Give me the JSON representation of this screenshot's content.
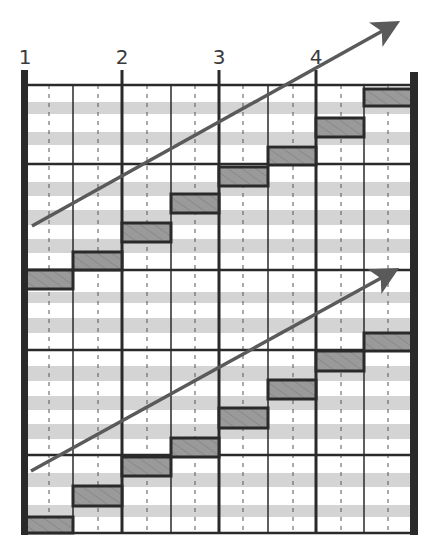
{
  "diagram": {
    "type": "staggered-step-pattern",
    "column_labels": [
      {
        "text": "1",
        "x": 25
      },
      {
        "text": "2",
        "x": 122
      },
      {
        "text": "3",
        "x": 219
      },
      {
        "text": "4",
        "x": 316
      }
    ],
    "colors": {
      "line": "#2a2a2a",
      "stripe": "#d4d4d4",
      "bar_fill": "#9a9a9a",
      "bar_hatch": "#7a7a7a",
      "arrow": "#5a5a5a",
      "label": "#3a3a3a"
    },
    "grid": {
      "left": 25,
      "right": 413,
      "top": 85,
      "bottom": 533,
      "major_vlines": [
        25,
        122,
        219,
        316,
        413
      ],
      "minor_vlines": [
        73,
        171,
        268,
        364
      ],
      "dashed_vlines": [
        49,
        98,
        147,
        195,
        243,
        293,
        341,
        388
      ],
      "hlines": [
        85,
        164,
        270,
        350,
        455,
        533
      ],
      "stripes": [
        [
          102,
          114
        ],
        [
          132,
          145
        ],
        [
          182,
          196
        ],
        [
          210,
          225
        ],
        [
          239,
          253
        ],
        [
          292,
          303
        ],
        [
          318,
          333
        ],
        [
          366,
          381
        ],
        [
          396,
          410
        ],
        [
          424,
          439
        ],
        [
          473,
          487
        ],
        [
          505,
          517
        ]
      ]
    },
    "bar_groups": [
      {
        "name": "upper-steps",
        "bars": [
          {
            "x": 25,
            "w": 48,
            "y": 270,
            "h": 19
          },
          {
            "x": 73,
            "w": 49,
            "y": 252,
            "h": 18
          },
          {
            "x": 122,
            "w": 49,
            "y": 223,
            "h": 19
          },
          {
            "x": 171,
            "w": 48,
            "y": 194,
            "h": 19
          },
          {
            "x": 219,
            "w": 49,
            "y": 167,
            "h": 19
          },
          {
            "x": 268,
            "w": 48,
            "y": 147,
            "h": 18
          },
          {
            "x": 316,
            "w": 48,
            "y": 118,
            "h": 19
          },
          {
            "x": 364,
            "w": 49,
            "y": 89,
            "h": 17
          }
        ]
      },
      {
        "name": "lower-steps",
        "bars": [
          {
            "x": 25,
            "w": 48,
            "y": 517,
            "h": 16
          },
          {
            "x": 73,
            "w": 49,
            "y": 486,
            "h": 20
          },
          {
            "x": 122,
            "w": 49,
            "y": 457,
            "h": 19
          },
          {
            "x": 171,
            "w": 48,
            "y": 438,
            "h": 19
          },
          {
            "x": 219,
            "w": 49,
            "y": 408,
            "h": 20
          },
          {
            "x": 268,
            "w": 48,
            "y": 380,
            "h": 19
          },
          {
            "x": 316,
            "w": 48,
            "y": 351,
            "h": 20
          },
          {
            "x": 364,
            "w": 49,
            "y": 333,
            "h": 18
          }
        ]
      }
    ],
    "arrows": [
      {
        "name": "upper-trend-arrow",
        "x1": 32,
        "y1": 226,
        "x2": 402,
        "y2": 20
      },
      {
        "name": "lower-trend-arrow",
        "x1": 31,
        "y1": 471,
        "x2": 401,
        "y2": 267
      }
    ]
  }
}
